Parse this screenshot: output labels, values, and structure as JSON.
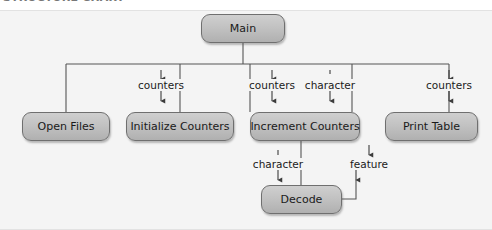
{
  "caption": {
    "text": "STRUCTURE CHART"
  },
  "diagram": {
    "background_color": "#f4f4f4",
    "node_fill_color": "#c2c2c2",
    "node_border_color": "#6f6f6f",
    "line_color": "#555555",
    "nodes": [
      {
        "id": "main",
        "label": "Main",
        "x": 201,
        "y": 14,
        "w": 84,
        "h": 29
      },
      {
        "id": "open",
        "label": "Open Files",
        "x": 22,
        "y": 112,
        "w": 88,
        "h": 29
      },
      {
        "id": "init",
        "label": "Initialize Counters",
        "x": 126,
        "y": 112,
        "w": 108,
        "h": 29
      },
      {
        "id": "incr",
        "label": "Increment Counters",
        "x": 250,
        "y": 112,
        "w": 110,
        "h": 29
      },
      {
        "id": "print",
        "label": "Print Table",
        "x": 385,
        "y": 112,
        "w": 93,
        "h": 29
      },
      {
        "id": "decode",
        "label": "Decode",
        "x": 261,
        "y": 185,
        "w": 81,
        "h": 29
      }
    ],
    "edge_labels": [
      {
        "id": "init-counters",
        "text": "counters",
        "x": 161,
        "y": 84
      },
      {
        "id": "incr-counters",
        "text": "counters",
        "x": 272,
        "y": 84
      },
      {
        "id": "incr-character",
        "text": "character",
        "x": 330,
        "y": 84
      },
      {
        "id": "print-counters",
        "text": "counters",
        "x": 449,
        "y": 84
      },
      {
        "id": "decode-character",
        "text": "character",
        "x": 278,
        "y": 163
      },
      {
        "id": "decode-feature",
        "text": "feature",
        "x": 369,
        "y": 163
      }
    ],
    "connections": [
      {
        "from": "main",
        "to": "open",
        "couple": null,
        "direction": "none"
      },
      {
        "from": "main",
        "to": "init",
        "couple": "counters",
        "direction": "both"
      },
      {
        "from": "main",
        "to": "incr",
        "couple": "counters",
        "direction": "both"
      },
      {
        "from": "main",
        "to": "incr",
        "couple": "character",
        "direction": "down"
      },
      {
        "from": "main",
        "to": "print",
        "couple": "counters",
        "direction": "down"
      },
      {
        "from": "incr",
        "to": "decode",
        "couple": "character",
        "direction": "down"
      },
      {
        "from": "decode",
        "to": "incr",
        "couple": "feature",
        "direction": "up"
      }
    ]
  }
}
